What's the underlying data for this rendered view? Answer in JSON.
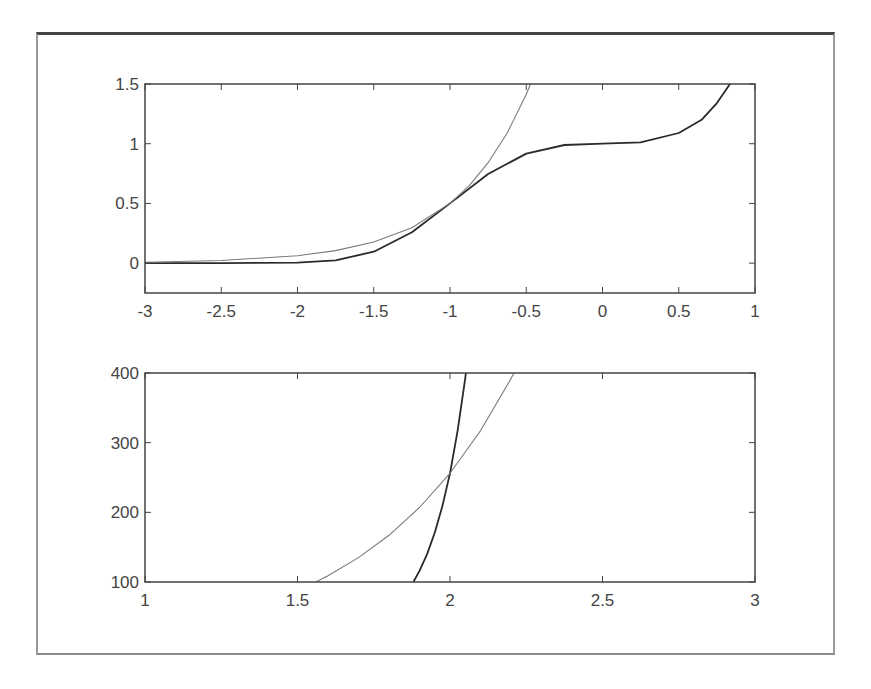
{
  "chart_data": [
    {
      "type": "line",
      "title": "",
      "xlabel": "",
      "ylabel": "",
      "xlim": [
        -3,
        1
      ],
      "ylim": [
        -0.25,
        1.5
      ],
      "xticks": [
        -3,
        -2.5,
        -2,
        -1.5,
        -1,
        -0.5,
        0,
        0.5,
        1
      ],
      "xtick_labels": [
        "-3",
        "-2.5",
        "-2",
        "-1.5",
        "-1",
        "-0.5",
        "0",
        "0.5",
        "1"
      ],
      "yticks": [
        0,
        0.5,
        1,
        1.5
      ],
      "ytick_labels": [
        "0",
        "0.5",
        "1",
        "1.5"
      ],
      "grid": false,
      "legend": null,
      "series": [
        {
          "name": "dark curve",
          "color": "#2a2a2a",
          "x": [
            -3,
            -2.5,
            -2,
            -1.75,
            -1.5,
            -1.25,
            -1,
            -0.75,
            -0.5,
            -0.25,
            0,
            0.25,
            0.5,
            0.65,
            0.75,
            0.836
          ],
          "y": [
            0,
            0,
            0.004,
            0.024,
            0.096,
            0.258,
            0.5,
            0.746,
            0.917,
            0.989,
            1,
            1.011,
            1.09,
            1.2,
            1.34,
            1.5
          ]
        },
        {
          "name": "light curve",
          "color": "#7a7a7a",
          "x": [
            -3,
            -2.5,
            -2,
            -1.75,
            -1.5,
            -1.25,
            -1,
            -0.875,
            -0.75,
            -0.625,
            -0.5,
            -0.472
          ],
          "y": [
            0.008,
            0.022,
            0.0625,
            0.105,
            0.177,
            0.297,
            0.5,
            0.648,
            0.841,
            1.09,
            1.414,
            1.5
          ]
        }
      ]
    },
    {
      "type": "line",
      "title": "",
      "xlabel": "",
      "ylabel": "",
      "xlim": [
        1,
        3
      ],
      "ylim": [
        100,
        400
      ],
      "xticks": [
        1,
        1.5,
        2,
        2.5,
        3
      ],
      "xtick_labels": [
        "1",
        "1.5",
        "2",
        "2.5",
        "3"
      ],
      "yticks": [
        100,
        200,
        300,
        400
      ],
      "ytick_labels": [
        "100",
        "200",
        "300",
        "400"
      ],
      "grid": false,
      "legend": null,
      "series": [
        {
          "name": "dark curve",
          "color": "#2a2a2a",
          "x": [
            1.88,
            1.9,
            1.925,
            1.95,
            1.975,
            2.0,
            2.025,
            2.05,
            2.052
          ],
          "y": [
            100,
            116,
            140,
            171,
            209,
            256,
            317,
            392,
            400
          ]
        },
        {
          "name": "light curve",
          "color": "#7a7a7a",
          "x": [
            1.56,
            1.6,
            1.7,
            1.8,
            1.9,
            2.0,
            2.1,
            2.2,
            2.21
          ],
          "y": [
            100,
            109,
            135,
            167,
            207,
            256,
            317,
            392,
            400
          ]
        }
      ]
    }
  ],
  "plots": [
    {
      "left": 145,
      "top": 84,
      "right": 755,
      "bottom": 293
    },
    {
      "left": 145,
      "top": 373,
      "right": 755,
      "bottom": 582
    }
  ]
}
